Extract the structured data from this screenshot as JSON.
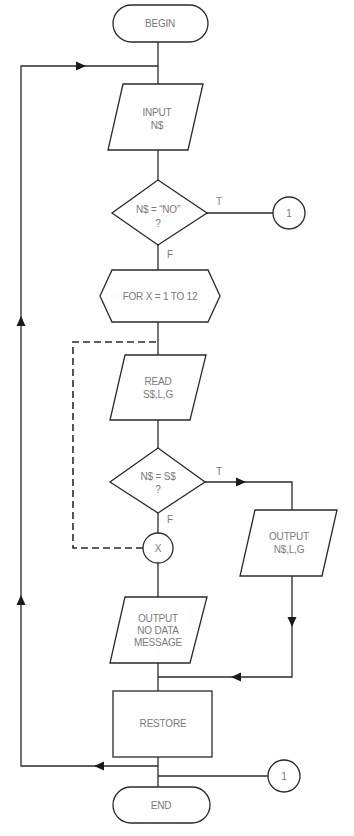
{
  "flowchart": {
    "nodes": {
      "begin": {
        "type": "terminator",
        "label": "BEGIN"
      },
      "input": {
        "type": "io",
        "lines": [
          "INPUT",
          "N$"
        ]
      },
      "decision_no": {
        "type": "decision",
        "lines": [
          "N$ = “NO”",
          "?"
        ]
      },
      "connector_top": {
        "type": "connector",
        "label": "1"
      },
      "loop_for": {
        "type": "preparation",
        "label": "FOR X = 1 TO 12"
      },
      "read": {
        "type": "io",
        "lines": [
          "READ",
          "S$,L,G"
        ]
      },
      "decision_match": {
        "type": "decision",
        "lines": [
          "N$ = S$",
          "?"
        ]
      },
      "loop_end": {
        "type": "connector",
        "label": "X"
      },
      "output_match": {
        "type": "io",
        "lines": [
          "OUTPUT",
          "N$,L,G"
        ]
      },
      "output_nodata": {
        "type": "io",
        "lines": [
          "OUTPUT",
          "NO DATA",
          "MESSAGE"
        ]
      },
      "restore": {
        "type": "process",
        "label": "RESTORE"
      },
      "connector_bottom": {
        "type": "connector",
        "label": "1"
      },
      "end": {
        "type": "terminator",
        "label": "END"
      }
    },
    "edge_labels": {
      "decision_no_true": "T",
      "decision_no_false": "F",
      "decision_match_true": "T",
      "decision_match_false": "F"
    },
    "colors": {
      "stroke": "#2a2a2a",
      "text": "#7a7a7a",
      "background": "#ffffff"
    }
  }
}
